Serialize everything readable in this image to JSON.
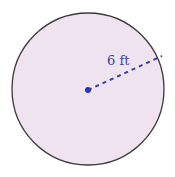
{
  "figure": {
    "shape": "circle",
    "radius_label": "6 ft",
    "radius_value": 6,
    "unit": "ft",
    "colors": {
      "fill": "#efe3ef",
      "stroke": "#3a3a3a",
      "accent": "#3b3fa0"
    }
  }
}
